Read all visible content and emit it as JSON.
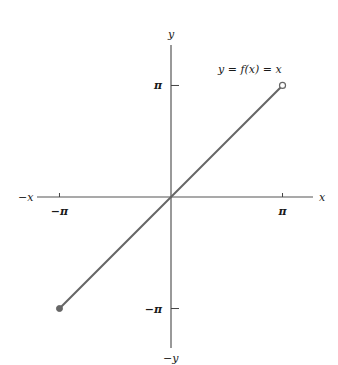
{
  "chart_data": {
    "type": "line",
    "title": "",
    "function_label": "y = f(x) = x",
    "xlabel_pos": "x",
    "xlabel_neg": "−x",
    "ylabel_pos": "y",
    "ylabel_neg": "−y",
    "x_ticks": [
      {
        "value": -3.14159,
        "label": "−π"
      },
      {
        "value": 3.14159,
        "label": "π"
      }
    ],
    "y_ticks": [
      {
        "value": 3.14159,
        "label": "π"
      },
      {
        "value": -3.14159,
        "label": "−π"
      }
    ],
    "xlim": [
      -3.45,
      4.3
    ],
    "ylim": [
      -4.4,
      4.3
    ],
    "grid": false,
    "series": [
      {
        "name": "y = x",
        "color": "#666666",
        "x": [
          -3.14159,
          3.14159
        ],
        "y": [
          -3.14159,
          3.14159
        ],
        "start_marker": "filled",
        "end_marker": "open"
      }
    ]
  }
}
